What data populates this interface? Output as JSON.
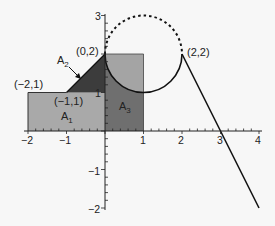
{
  "diagram": {
    "axes": {
      "x_ticks": [
        "−2",
        "−1",
        "1",
        "2",
        "3",
        "4"
      ],
      "y_ticks": [
        "3",
        "1",
        "−1",
        "−2"
      ]
    },
    "points": {
      "p_neg2_1": "(−2,1)",
      "p_neg1_1": "(−1,1)",
      "p_0_2": "(0,2)",
      "p_2_2": "(2,2)"
    },
    "regions": {
      "a1": {
        "label": "A",
        "sub": "1"
      },
      "a2": {
        "label": "A",
        "sub": "2"
      },
      "a3": {
        "label": "A",
        "sub": "3"
      }
    },
    "colors": {
      "a1": "#a9a9a9",
      "a2": "#3c3c3c",
      "a3": "#6f6f6f",
      "square_upper": "#a4a4a4",
      "line": "#111111",
      "background": "#f7f7f7"
    }
  }
}
